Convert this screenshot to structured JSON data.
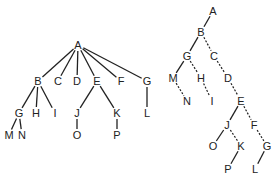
{
  "diagrams": [
    {
      "name": "general-tree",
      "nodes": [
        {
          "id": "A",
          "label": "A",
          "x": 78,
          "y": 45
        },
        {
          "id": "B",
          "label": "B",
          "x": 38,
          "y": 81
        },
        {
          "id": "C",
          "label": "C",
          "x": 58,
          "y": 81
        },
        {
          "id": "D",
          "label": "D",
          "x": 77,
          "y": 81
        },
        {
          "id": "E",
          "label": "E",
          "x": 97,
          "y": 81
        },
        {
          "id": "F",
          "label": "F",
          "x": 121,
          "y": 81
        },
        {
          "id": "G1",
          "label": "G",
          "x": 147,
          "y": 81
        },
        {
          "id": "G",
          "label": "G",
          "x": 19,
          "y": 113
        },
        {
          "id": "H",
          "label": "H",
          "x": 36,
          "y": 113
        },
        {
          "id": "I",
          "label": "I",
          "x": 55,
          "y": 113
        },
        {
          "id": "J",
          "label": "J",
          "x": 77,
          "y": 113
        },
        {
          "id": "K",
          "label": "K",
          "x": 117,
          "y": 113
        },
        {
          "id": "L",
          "label": "L",
          "x": 147,
          "y": 113
        },
        {
          "id": "M",
          "label": "M",
          "x": 9,
          "y": 135
        },
        {
          "id": "N",
          "label": "N",
          "x": 22,
          "y": 135
        },
        {
          "id": "O",
          "label": "O",
          "x": 77,
          "y": 135
        },
        {
          "id": "P",
          "label": "P",
          "x": 117,
          "y": 135
        }
      ],
      "edges": [
        [
          "A",
          "B"
        ],
        [
          "A",
          "C"
        ],
        [
          "A",
          "D"
        ],
        [
          "A",
          "E"
        ],
        [
          "A",
          "F"
        ],
        [
          "A",
          "G1"
        ],
        [
          "B",
          "G"
        ],
        [
          "B",
          "H"
        ],
        [
          "B",
          "I"
        ],
        [
          "E",
          "J"
        ],
        [
          "E",
          "K"
        ],
        [
          "G1",
          "L"
        ],
        [
          "G",
          "M"
        ],
        [
          "G",
          "N"
        ],
        [
          "J",
          "O"
        ],
        [
          "K",
          "P"
        ]
      ]
    },
    {
      "name": "binary-tree-representation",
      "nodes": [
        {
          "id": "A",
          "label": "A",
          "x": 213,
          "y": 11
        },
        {
          "id": "B",
          "label": "B",
          "x": 201,
          "y": 32
        },
        {
          "id": "G",
          "label": "G",
          "x": 187,
          "y": 56
        },
        {
          "id": "C",
          "label": "C",
          "x": 214,
          "y": 56
        },
        {
          "id": "M",
          "label": "M",
          "x": 173,
          "y": 78
        },
        {
          "id": "H",
          "label": "H",
          "x": 201,
          "y": 78
        },
        {
          "id": "D",
          "label": "D",
          "x": 228,
          "y": 78
        },
        {
          "id": "N",
          "label": "N",
          "x": 187,
          "y": 101
        },
        {
          "id": "I",
          "label": "I",
          "x": 212,
          "y": 101
        },
        {
          "id": "E",
          "label": "E",
          "x": 241,
          "y": 101
        },
        {
          "id": "J",
          "label": "J",
          "x": 227,
          "y": 125
        },
        {
          "id": "F",
          "label": "F",
          "x": 254,
          "y": 125
        },
        {
          "id": "O",
          "label": "O",
          "x": 213,
          "y": 146
        },
        {
          "id": "K",
          "label": "K",
          "x": 241,
          "y": 146
        },
        {
          "id": "G2",
          "label": "G",
          "x": 267,
          "y": 146
        },
        {
          "id": "P",
          "label": "P",
          "x": 228,
          "y": 169
        },
        {
          "id": "L",
          "label": "L",
          "x": 255,
          "y": 169
        }
      ],
      "solid_edges": [
        [
          "A",
          "B"
        ],
        [
          "B",
          "G"
        ],
        [
          "G",
          "M"
        ],
        [
          "E",
          "J"
        ],
        [
          "J",
          "O"
        ],
        [
          "K",
          "P"
        ],
        [
          "G2",
          "L"
        ]
      ],
      "dashed_edges": [
        [
          "B",
          "C"
        ],
        [
          "C",
          "D"
        ],
        [
          "D",
          "E"
        ],
        [
          "G",
          "H"
        ],
        [
          "H",
          "I"
        ],
        [
          "M",
          "N"
        ],
        [
          "J",
          "K"
        ],
        [
          "E",
          "F"
        ],
        [
          "F",
          "G2"
        ]
      ]
    }
  ]
}
